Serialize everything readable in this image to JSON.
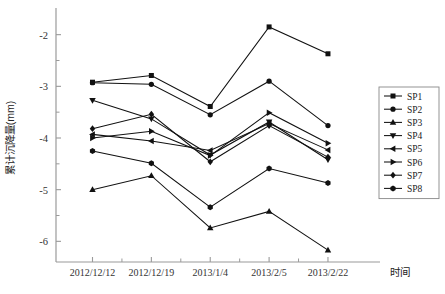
{
  "chart_data": {
    "type": "line",
    "title": "",
    "xlabel": "时间",
    "ylabel": "累计沉降量(mm)",
    "categories": [
      "2012/12/12",
      "2012/12/19",
      "2013/1/4",
      "2013/2/5",
      "2013/2/22"
    ],
    "ylim": [
      -6.4,
      -1.6
    ],
    "yticks": [
      -2,
      -3,
      -4,
      -5,
      -6
    ],
    "ytick_labels": [
      "-2",
      "-3",
      "-4",
      "-5",
      "-6"
    ],
    "minor_yticks": [
      -2.5,
      -3.5,
      -4.5,
      -5.5
    ],
    "grid": false,
    "legend_position": "right",
    "series": [
      {
        "name": "SP1",
        "marker": "square",
        "values": [
          -2.92,
          -2.79,
          -3.39,
          -1.85,
          -2.37
        ]
      },
      {
        "name": "SP2",
        "marker": "circle",
        "values": [
          -2.93,
          -2.96,
          -3.55,
          -2.9,
          -3.76
        ]
      },
      {
        "name": "SP3",
        "marker": "triangle-up",
        "values": [
          -5.0,
          -4.73,
          -5.74,
          -5.42,
          -6.17
        ]
      },
      {
        "name": "SP4",
        "marker": "triangle-down",
        "values": [
          -3.27,
          -3.63,
          -4.33,
          -3.69,
          -4.42
        ]
      },
      {
        "name": "SP5",
        "marker": "triangle-left",
        "values": [
          -3.93,
          -4.06,
          -4.24,
          -3.72,
          -4.23
        ]
      },
      {
        "name": "SP6",
        "marker": "triangle-right",
        "values": [
          -4.0,
          -3.87,
          -4.34,
          -3.51,
          -4.1
        ]
      },
      {
        "name": "SP7",
        "marker": "diamond",
        "values": [
          -3.82,
          -3.54,
          -4.46,
          -3.76,
          -4.37
        ]
      },
      {
        "name": "SP8",
        "marker": "hexagon",
        "values": [
          -4.25,
          -4.49,
          -5.34,
          -4.59,
          -4.87
        ]
      }
    ]
  },
  "legend": {
    "items": [
      "SP1",
      "SP2",
      "SP3",
      "SP4",
      "SP5",
      "SP6",
      "SP7",
      "SP8"
    ]
  },
  "axes": {
    "x_title": "时间",
    "y_title": "累计沉降量(mm)",
    "line_color": "#222222"
  }
}
